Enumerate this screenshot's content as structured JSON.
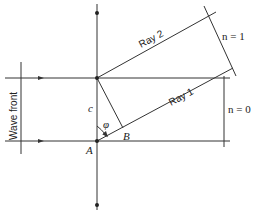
{
  "labels": {
    "wave_front": "Wave front",
    "ray1": "Ray 1",
    "ray2": "Ray 2",
    "n1": "n = 1",
    "n0": "n = 0",
    "c": "c",
    "phi": "φ",
    "A": "A",
    "B": "B"
  },
  "colors": {
    "line": "#333333",
    "background": "#ffffff"
  }
}
